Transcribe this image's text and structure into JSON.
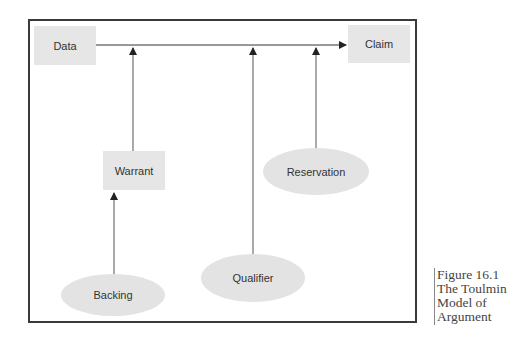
{
  "diagram": {
    "title": "The Toulmin Model of Argument",
    "nodes": {
      "data": {
        "label": "Data",
        "shape": "rectangle"
      },
      "claim": {
        "label": "Claim",
        "shape": "rectangle"
      },
      "warrant": {
        "label": "Warrant",
        "shape": "rectangle"
      },
      "reservation": {
        "label": "Reservation",
        "shape": "ellipse"
      },
      "qualifier": {
        "label": "Qualifier",
        "shape": "ellipse"
      },
      "backing": {
        "label": "Backing",
        "shape": "ellipse"
      }
    },
    "edges": [
      {
        "from": "data",
        "to": "claim"
      },
      {
        "from": "warrant",
        "to": "data-claim-line"
      },
      {
        "from": "qualifier",
        "to": "data-claim-line"
      },
      {
        "from": "reservation",
        "to": "data-claim-line"
      },
      {
        "from": "backing",
        "to": "warrant"
      }
    ],
    "colors": {
      "node_fill": "#e6e6e6",
      "frame": "#3a3a3a",
      "line": "#555555"
    }
  },
  "caption": {
    "line1": "Figure 16.1",
    "line2": "The Toulmin",
    "line3": "Model of",
    "line4": "Argument"
  }
}
